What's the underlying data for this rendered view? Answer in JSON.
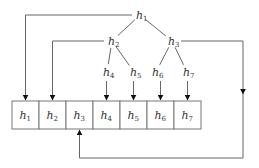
{
  "diagram": {
    "type": "binary-heap-to-array-mapping",
    "tree_nodes": [
      {
        "id": "h1",
        "base": "h",
        "sub": "1"
      },
      {
        "id": "h2",
        "base": "h",
        "sub": "2"
      },
      {
        "id": "h3",
        "base": "h",
        "sub": "3"
      },
      {
        "id": "h4",
        "base": "h",
        "sub": "4"
      },
      {
        "id": "h5",
        "base": "h",
        "sub": "5"
      },
      {
        "id": "h6",
        "base": "h",
        "sub": "6"
      },
      {
        "id": "h7",
        "base": "h",
        "sub": "7"
      }
    ],
    "tree_edges": [
      [
        "h1",
        "h2"
      ],
      [
        "h1",
        "h3"
      ],
      [
        "h2",
        "h4"
      ],
      [
        "h2",
        "h5"
      ],
      [
        "h3",
        "h6"
      ],
      [
        "h3",
        "h7"
      ]
    ],
    "array_cells": [
      {
        "base": "h",
        "sub": "1"
      },
      {
        "base": "h",
        "sub": "2"
      },
      {
        "base": "h",
        "sub": "3"
      },
      {
        "base": "h",
        "sub": "4"
      },
      {
        "base": "h",
        "sub": "5"
      },
      {
        "base": "h",
        "sub": "6"
      },
      {
        "base": "h",
        "sub": "7"
      }
    ],
    "mappings": [
      {
        "from": "h1",
        "to_cell": 1
      },
      {
        "from": "h2",
        "to_cell": 2
      },
      {
        "from": "h3",
        "to_cell": 3
      },
      {
        "from": "h4",
        "to_cell": 4
      },
      {
        "from": "h5",
        "to_cell": 5
      },
      {
        "from": "h6",
        "to_cell": 6
      },
      {
        "from": "h7",
        "to_cell": 7
      }
    ]
  }
}
